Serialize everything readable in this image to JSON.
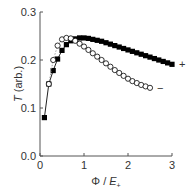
{
  "chart_data": {
    "type": "scatter",
    "title": "",
    "xlabel": "Φ / E₊",
    "xlabel_parts": {
      "phi": "Φ / ",
      "e": "E",
      "sub": "+"
    },
    "ylabel": "T (arb.)",
    "ylabel_parts": {
      "t": "T",
      "rest": " (arb.)"
    },
    "xlim": [
      0,
      3
    ],
    "ylim": [
      0.0,
      0.3
    ],
    "xticks": [
      0,
      1,
      2,
      3
    ],
    "xtick_labels": [
      "0",
      "1",
      "2",
      "3"
    ],
    "yticks": [
      0.0,
      0.1,
      0.2,
      0.3
    ],
    "ytick_labels": [
      "0.0",
      "0.1",
      "0.2",
      "0.3"
    ],
    "grid": false,
    "legend": "inline labels at series ends",
    "series": [
      {
        "name": "+",
        "marker": "filled-square",
        "color": "#000000",
        "x": [
          0.1,
          0.2,
          0.3,
          0.4,
          0.5,
          0.6,
          0.7,
          0.8,
          0.9,
          1.0,
          1.1,
          1.2,
          1.3,
          1.4,
          1.5,
          1.6,
          1.7,
          1.8,
          1.9,
          2.0,
          2.1,
          2.2,
          2.3,
          2.4,
          2.5,
          2.6,
          2.7,
          2.8,
          2.9,
          3.0
        ],
        "y": [
          0.08,
          0.15,
          0.178,
          0.202,
          0.22,
          0.232,
          0.24,
          0.244,
          0.246,
          0.246,
          0.245,
          0.243,
          0.241,
          0.239,
          0.236,
          0.233,
          0.23,
          0.227,
          0.224,
          0.221,
          0.218,
          0.215,
          0.212,
          0.209,
          0.206,
          0.203,
          0.2,
          0.197,
          0.194,
          0.191
        ]
      },
      {
        "name": "−",
        "marker": "open-circle",
        "color": "#000000",
        "x": [
          0.2,
          0.3,
          0.4,
          0.5,
          0.6,
          0.7,
          0.8,
          0.9,
          1.0,
          1.1,
          1.2,
          1.3,
          1.4,
          1.5,
          1.6,
          1.7,
          1.8,
          1.9,
          2.0,
          2.1,
          2.2,
          2.3,
          2.4,
          2.5
        ],
        "y": [
          0.15,
          0.2,
          0.23,
          0.243,
          0.246,
          0.245,
          0.24,
          0.234,
          0.228,
          0.221,
          0.214,
          0.207,
          0.2,
          0.193,
          0.186,
          0.179,
          0.173,
          0.167,
          0.161,
          0.156,
          0.152,
          0.148,
          0.145,
          0.142
        ]
      }
    ]
  }
}
